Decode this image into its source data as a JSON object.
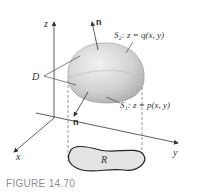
{
  "figure": {
    "caption": "FIGURE 14.70",
    "labels": {
      "z_axis": "z",
      "x_axis": "x",
      "y_axis": "y",
      "normal_top": "n",
      "normal_bottom": "n",
      "region_D": "D",
      "region_R": "R",
      "surface_top": "S₂: z = q(x, y)",
      "surface_bottom": "S₁: z = p(x, y)"
    },
    "colors": {
      "solid_fill": "#d6d6d6",
      "region_fill": "#e4e4e4",
      "axis": "#333333",
      "caption": "#8a8f96"
    }
  }
}
